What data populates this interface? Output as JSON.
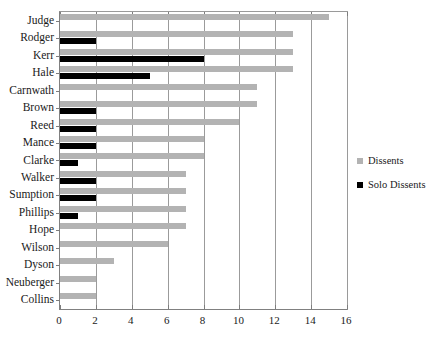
{
  "chart_data": {
    "type": "bar",
    "orientation": "horizontal",
    "title": "",
    "xlabel": "",
    "ylabel": "",
    "xlim": [
      0,
      16
    ],
    "xticks": [
      0,
      2,
      4,
      6,
      8,
      10,
      12,
      14,
      16
    ],
    "grid": true,
    "grid_axis": "x",
    "legend_position": "right",
    "categories": [
      "Judge",
      "Rodger",
      "Kerr",
      "Hale",
      "Carnwath",
      "Brown",
      "Reed",
      "Mance",
      "Clarke",
      "Walker",
      "Sumption",
      "Phillips",
      "Hope",
      "Wilson",
      "Dyson",
      "Neuberger",
      "Collins"
    ],
    "series": [
      {
        "name": "Dissents",
        "color": "#b3b3b3",
        "values": [
          15,
          13,
          13,
          13,
          11,
          11,
          10,
          8,
          8,
          7,
          7,
          7,
          7,
          6,
          3,
          2,
          2
        ]
      },
      {
        "name": "Solo Dissents",
        "color": "#000000",
        "values": [
          0,
          2,
          8,
          5,
          0,
          2,
          2,
          2,
          1,
          2,
          2,
          1,
          0,
          0,
          0,
          0,
          0
        ]
      }
    ]
  },
  "legend": {
    "items": [
      {
        "label": "Dissents",
        "color": "#b3b3b3"
      },
      {
        "label": "Solo Dissents",
        "color": "#000000"
      }
    ]
  }
}
